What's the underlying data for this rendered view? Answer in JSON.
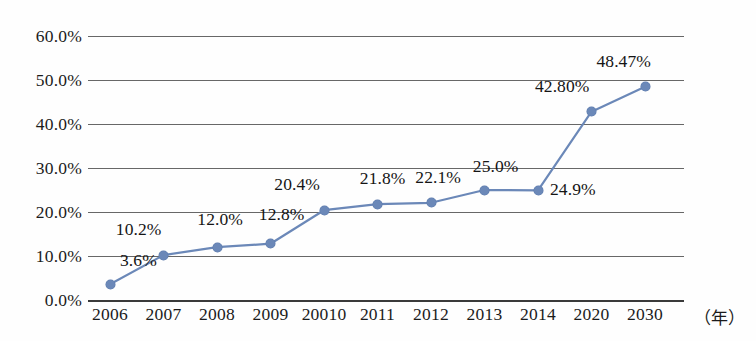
{
  "chart_data": {
    "type": "line",
    "title": "",
    "xlabel": "（年）",
    "ylabel": "",
    "grid": "horizontal",
    "legend": "none",
    "ylim": [
      0,
      60
    ],
    "ytick_labels": [
      "60.0%",
      "50.0%",
      "40.0%",
      "30.0%",
      "20.0%",
      "10.0%",
      "0.0%"
    ],
    "ytick_values": [
      60,
      50,
      40,
      30,
      20,
      10,
      0
    ],
    "categories": [
      "2006",
      "2007",
      "2008",
      "2009",
      "20010",
      "2011",
      "2012",
      "2013",
      "2014",
      "2020",
      "2030"
    ],
    "values": [
      3.6,
      10.2,
      12.0,
      12.8,
      20.4,
      21.8,
      22.1,
      25.0,
      24.9,
      42.8,
      48.47
    ],
    "point_labels": [
      "3.6%",
      "10.2%",
      "12.0%",
      "12.8%",
      "20.4%",
      "21.8%",
      "22.1%",
      "25.0%",
      "24.9%",
      "42.80%",
      "48.47%"
    ],
    "series_color": "#6b88b8",
    "grid_color": "#4c4c4c",
    "axis_color": "#3a3a3a",
    "text_color": "#1b1b1b"
  },
  "labels": {
    "y0": "60.0%",
    "y1": "50.0%",
    "y2": "40.0%",
    "y3": "30.0%",
    "y4": "20.0%",
    "y5": "10.0%",
    "y6": "0.0%",
    "x0": "2006",
    "x1": "2007",
    "x2": "2008",
    "x3": "2009",
    "x4": "20010",
    "x5": "2011",
    "x6": "2012",
    "x7": "2013",
    "x8": "2014",
    "x9": "2020",
    "x10": "2030",
    "unit": "（年）",
    "d0": "3.6%",
    "d1": "10.2%",
    "d2": "12.0%",
    "d3": "12.8%",
    "d4": "20.4%",
    "d5": "21.8%",
    "d6": "22.1%",
    "d7": "25.0%",
    "d8": "24.9%",
    "d9": "42.80%",
    "d10": "48.47%"
  }
}
